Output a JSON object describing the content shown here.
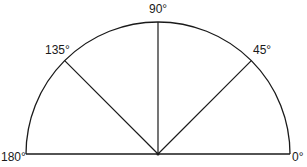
{
  "diagram": {
    "type": "semicircle-protractor",
    "stroke_color": "#1a1a1a",
    "background": "#ffffff",
    "center": {
      "x": 158,
      "y": 154
    },
    "radius": 132,
    "angles": [
      {
        "deg": 0,
        "label": "0°"
      },
      {
        "deg": 45,
        "label": "45°"
      },
      {
        "deg": 90,
        "label": "90°"
      },
      {
        "deg": 135,
        "label": "135°"
      },
      {
        "deg": 180,
        "label": "180°"
      }
    ]
  }
}
